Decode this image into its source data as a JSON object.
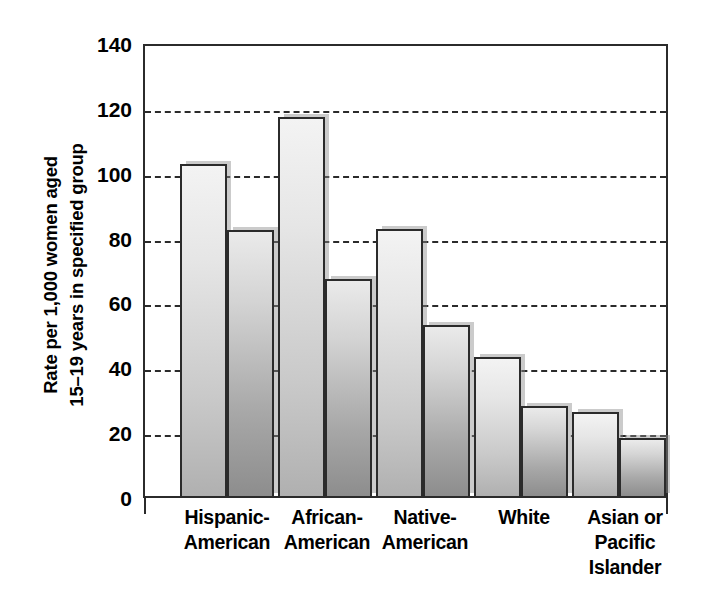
{
  "chart_data": {
    "type": "bar",
    "title": "",
    "subtitle": "",
    "xlabel": "",
    "ylabel_lines": [
      "Rate per 1,000 women aged",
      "15–19 years in specified group"
    ],
    "ylabel": "Rate per 1,000 women aged 15–19 years in specified group",
    "categories": [
      "Hispanic-American",
      "African-American",
      "Native-American",
      "White",
      "Asian or Pacific Islander"
    ],
    "category_label_lines": [
      [
        "Hispanic-",
        "American"
      ],
      [
        "African-",
        "American"
      ],
      [
        "Native-",
        "American"
      ],
      [
        "White"
      ],
      [
        "Asian or",
        "Pacific",
        "Islander"
      ]
    ],
    "series": [
      {
        "name": "series-1",
        "values": [
          103,
          117.5,
          83,
          43.5,
          26.5
        ]
      },
      {
        "name": "series-2",
        "values": [
          82.5,
          67.5,
          53.5,
          28.5,
          18.5
        ]
      }
    ],
    "ylim": [
      0,
      140
    ],
    "ytick_values": [
      140,
      120,
      100,
      80,
      60,
      40,
      20,
      0
    ],
    "ytick_labels": [
      "140",
      "120",
      "100",
      "80",
      "60",
      "40",
      "20",
      "0"
    ],
    "gridline_values": [
      120,
      100,
      80,
      60,
      40,
      20
    ],
    "grid": true,
    "legend": "none",
    "legend_position": "none",
    "colors": {
      "series1_top": "#f3f3f3",
      "series1_bottom": "#b0b0b0",
      "series2_top": "#eaeaea",
      "series2_bottom": "#8d8d8d",
      "axis": "#2b2b2b",
      "grid": "#2b2b2b",
      "background": "#ffffff",
      "text": "#000000"
    }
  }
}
